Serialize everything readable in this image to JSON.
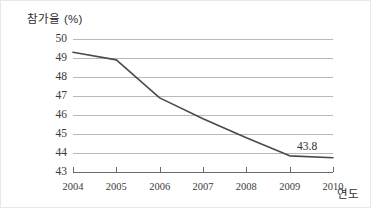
{
  "chart_data": {
    "type": "line",
    "title": "",
    "xlabel": "연도",
    "ylabel": "참가율 (%)",
    "x": [
      2004,
      2005,
      2006,
      2007,
      2008,
      2009,
      2010
    ],
    "categories": [
      "2004",
      "2005",
      "2006",
      "2007",
      "2008",
      "2009",
      "2010"
    ],
    "values": [
      49.3,
      48.9,
      46.9,
      45.8,
      44.8,
      43.85,
      43.75
    ],
    "series": [
      {
        "name": "참가율",
        "values": [
          49.3,
          48.9,
          46.9,
          45.8,
          44.8,
          43.85,
          43.75
        ]
      }
    ],
    "ylim": [
      43,
      50
    ],
    "yticks": [
      43,
      44,
      45,
      46,
      47,
      48,
      49,
      50
    ],
    "ytick_labels": [
      "43",
      "44",
      "45",
      "46",
      "47",
      "48",
      "49",
      "50"
    ],
    "xlim": [
      2004,
      2010
    ],
    "grid": true,
    "legend": false,
    "annotations": [
      {
        "text": "43.8",
        "x": 2010,
        "y": 43.8
      }
    ],
    "colors": {
      "line": "#4a4a4a",
      "gridline": "#b9b9b9",
      "axis": "#6a6a6a",
      "text": "#3b3b3b"
    }
  }
}
